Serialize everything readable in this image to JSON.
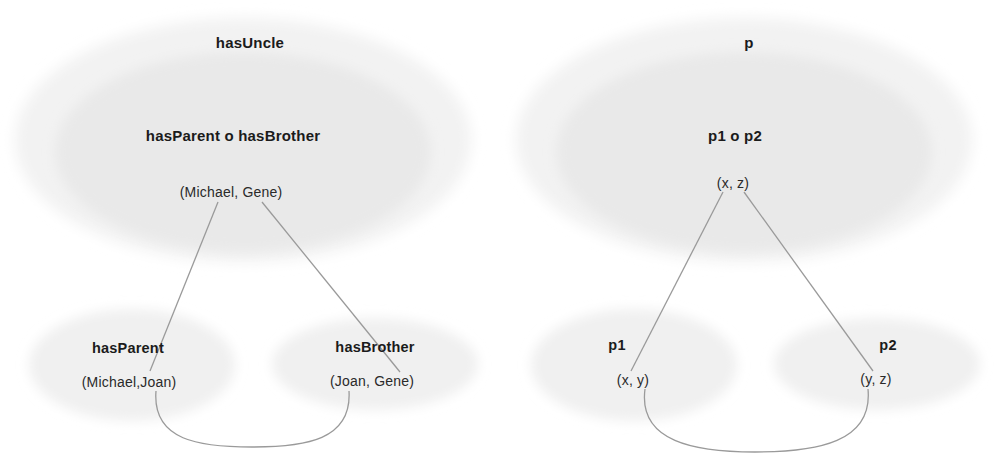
{
  "diagram": {
    "title_hidden": "",
    "panels": [
      {
        "id": "concrete-example",
        "outer_ellipse_label": "hasUncle",
        "inner_ellipse_label": "hasParent o hasBrother",
        "composed_pair": "(Michael, Gene)",
        "left_ellipse_label": "hasParent",
        "left_pair": "(Michael,Joan)",
        "right_ellipse_label": "hasBrother",
        "right_pair": "(Joan, Gene)"
      },
      {
        "id": "abstract-schema",
        "outer_ellipse_label": "p",
        "inner_ellipse_label": "p1 o p2",
        "composed_pair": "(x, z)",
        "left_ellipse_label": "p1",
        "left_pair": "(x, y)",
        "right_ellipse_label": "p2",
        "right_pair": "(y, z)"
      }
    ]
  },
  "colors": {
    "background": "#ffffff",
    "text": "#1b1b1b",
    "pair_text": "#2a2a2a",
    "ellipse_fill_outer": "#f2f2f2",
    "ellipse_fill_inner": "#ededed",
    "ellipse_fill_small": "#f1f1f1",
    "connector_stroke": "#9a9a9a"
  }
}
